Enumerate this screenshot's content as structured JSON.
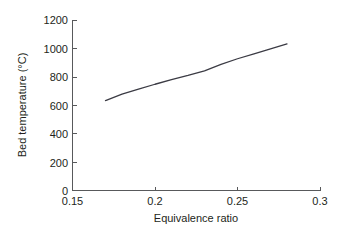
{
  "chart_data": {
    "type": "line",
    "title": "",
    "xlabel": "Equivalence ratio",
    "ylabel": "Bed temperature (°C)",
    "xlim": [
      0.15,
      0.3
    ],
    "ylim": [
      0,
      1200
    ],
    "grid": false,
    "legend": null,
    "xticks": [
      "0.15",
      "0.2",
      "0.25",
      "0.3"
    ],
    "xtick_values": [
      0.15,
      0.2,
      0.25,
      0.3
    ],
    "yticks": [
      "0",
      "200",
      "400",
      "600",
      "800",
      "1000",
      "1200"
    ],
    "ytick_values": [
      0,
      200,
      400,
      600,
      800,
      1000,
      1200
    ],
    "series": [
      {
        "name": "Bed temperature",
        "color": "#3b3b44",
        "x": [
          0.17,
          0.18,
          0.19,
          0.2,
          0.21,
          0.22,
          0.23,
          0.24,
          0.25,
          0.26,
          0.27,
          0.28
        ],
        "y": [
          635,
          680,
          715,
          750,
          782,
          812,
          845,
          890,
          930,
          965,
          1000,
          1035
        ]
      }
    ]
  },
  "axes": {
    "x_tick_labels": [
      "0.15",
      "0.2",
      "0.25",
      "0.3"
    ],
    "y_tick_labels": [
      "1200",
      "1000",
      "800",
      "600",
      "400",
      "200",
      "0"
    ],
    "x_axis_title": "Equivalence ratio",
    "y_axis_title": "Bed temperature (°C)"
  }
}
